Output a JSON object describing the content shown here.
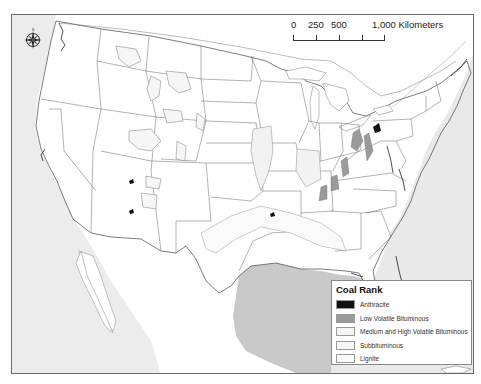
{
  "map": {
    "title": "Coal Rank map of the conterminous United States",
    "colors": {
      "land": "#ffffff",
      "pacific_ocean": "#ececec",
      "atlantic_ocean": "#e9e9e9",
      "gulf_of_mexico": "#c9c9c9",
      "boundary": "#555555",
      "frame": "#6a6a6a"
    }
  },
  "north_arrow": {
    "icon": "compass-rose-icon",
    "labels": {
      "n": "N",
      "s": "S",
      "e": "E",
      "w": "W"
    }
  },
  "scale_bar": {
    "labels": [
      "0",
      "250",
      "500",
      "1,000 Kilometers"
    ]
  },
  "legend": {
    "title": "Coal Rank",
    "items": [
      {
        "label": "Anthracite",
        "color": "#111111"
      },
      {
        "label": "Low Volatile Bituminous",
        "color": "#9a9a9a"
      },
      {
        "label": "Medium and High Volatile Bituminous",
        "color": "#f4f4f4"
      },
      {
        "label": "Subbituminous",
        "color": "#f7f7f7"
      },
      {
        "label": "Lignite",
        "color": "#fbfbfb"
      }
    ]
  }
}
